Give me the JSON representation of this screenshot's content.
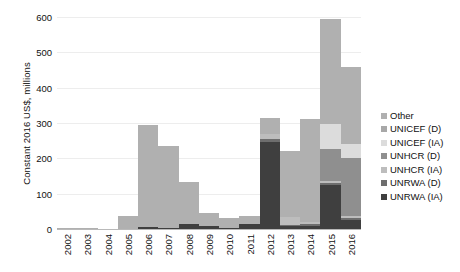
{
  "chart_data": {
    "type": "bar",
    "stacked": true,
    "title": "",
    "subtitle": "",
    "xlabel": "",
    "ylabel": "Constant 2016 US$, millions",
    "ylim": [
      0,
      600
    ],
    "ytick_labels": [
      "0",
      "100",
      "200",
      "300",
      "400",
      "500",
      "600"
    ],
    "ytick_values": [
      0,
      100,
      200,
      300,
      400,
      500,
      600
    ],
    "grid": true,
    "legend_position": "right",
    "categories": [
      "2002",
      "2003",
      "2004",
      "2005",
      "2006",
      "2007",
      "2008",
      "2009",
      "2010",
      "2011",
      "2012",
      "2013",
      "2014",
      "2015",
      "2016"
    ],
    "series": [
      {
        "name": "UNRWA (IA)",
        "color": "#3f3f3f",
        "values": [
          0,
          0,
          0,
          0,
          5,
          4,
          15,
          8,
          4,
          14,
          245,
          8,
          9,
          125,
          25
        ]
      },
      {
        "name": "UNRWA (D)",
        "color": "#6e6e6e",
        "values": [
          0,
          0,
          0,
          0,
          0,
          0,
          0,
          0,
          0,
          0,
          10,
          4,
          5,
          6,
          6
        ]
      },
      {
        "name": "UNHCR (IA)",
        "color": "#bdbdbd",
        "values": [
          0,
          0,
          0,
          0,
          0,
          0,
          0,
          0,
          0,
          0,
          14,
          23,
          5,
          5,
          5
        ]
      },
      {
        "name": "UNHCR (D)",
        "color": "#8f8f8f",
        "values": [
          0,
          0,
          0,
          0,
          0,
          0,
          0,
          0,
          0,
          0,
          0,
          0,
          0,
          90,
          165
        ]
      },
      {
        "name": "UNICEF (IA)",
        "color": "#dcdcdc",
        "values": [
          0,
          0,
          0,
          0,
          0,
          0,
          0,
          0,
          0,
          0,
          0,
          0,
          0,
          70,
          40
        ]
      },
      {
        "name": "UNICEF (D)",
        "color": "#a8a8a8",
        "values": [
          0,
          0,
          0,
          0,
          0,
          0,
          0,
          0,
          0,
          0,
          0,
          0,
          0,
          0,
          0
        ]
      },
      {
        "name": "Other",
        "color": "#b0b0b0",
        "values": [
          3,
          2,
          1,
          38,
          290,
          231,
          118,
          37,
          26,
          22,
          44,
          187,
          291,
          299,
          219
        ]
      }
    ],
    "totals": [
      3,
      2,
      1,
      38,
      295,
      235,
      133,
      45,
      30,
      36,
      313,
      222,
      310,
      595,
      460
    ]
  },
  "legend": {
    "items": [
      {
        "label": "Other",
        "color": "#b0b0b0"
      },
      {
        "label": "UNICEF (D)",
        "color": "#a8a8a8"
      },
      {
        "label": "UNICEF (IA)",
        "color": "#dcdcdc"
      },
      {
        "label": "UNHCR (D)",
        "color": "#8f8f8f"
      },
      {
        "label": "UNHCR (IA)",
        "color": "#bdbdbd"
      },
      {
        "label": "UNRWA (D)",
        "color": "#6e6e6e"
      },
      {
        "label": "UNRWA (IA)",
        "color": "#3f3f3f"
      }
    ]
  }
}
